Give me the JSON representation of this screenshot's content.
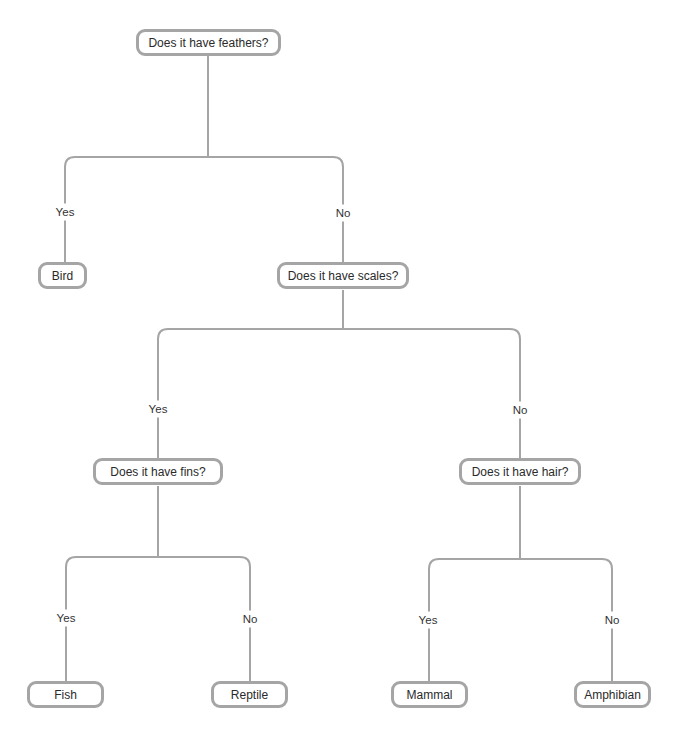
{
  "diagram": {
    "type": "decision-tree",
    "line_color": "#a5a5a5",
    "nodes": {
      "feathers": "Does it have feathers?",
      "bird": "Bird",
      "scales": "Does it have scales?",
      "fins": "Does it have fins?",
      "hair": "Does it have hair?",
      "fish": "Fish",
      "reptile": "Reptile",
      "mammal": "Mammal",
      "amphibian": "Amphibian"
    },
    "edges": {
      "feathers_yes": "Yes",
      "feathers_no": "No",
      "scales_yes": "Yes",
      "scales_no": "No",
      "fins_yes": "Yes",
      "fins_no": "No",
      "hair_yes": "Yes",
      "hair_no": "No"
    }
  }
}
